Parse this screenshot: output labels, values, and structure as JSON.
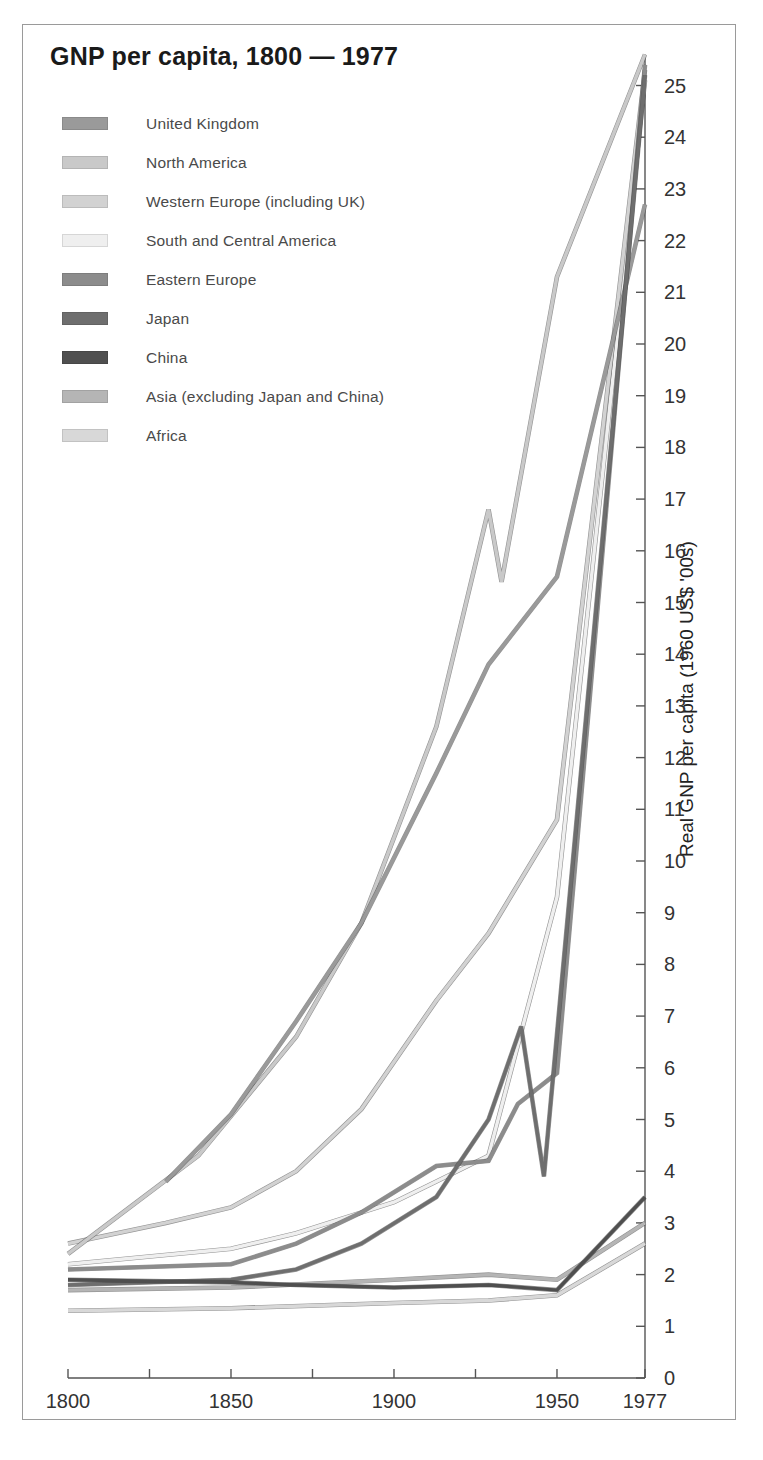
{
  "title": "GNP per capita, 1800 — 1977",
  "legend": [
    {
      "label": "United Kingdom",
      "color": "#9a9a9a"
    },
    {
      "label": "North America",
      "color": "#c9c9c9"
    },
    {
      "label": "Western Europe (including UK)",
      "color": "#d2d2d2"
    },
    {
      "label": "South and Central America",
      "color": "#efefef"
    },
    {
      "label": "Eastern Europe",
      "color": "#8c8c8c"
    },
    {
      "label": "Japan",
      "color": "#6e6e6e"
    },
    {
      "label": "China",
      "color": "#4f4f4f"
    },
    {
      "label": "Asia (excluding Japan and China)",
      "color": "#b5b5b5"
    },
    {
      "label": "Africa",
      "color": "#d8d8d8"
    }
  ],
  "axes": {
    "y_title": "Real GNP per capita (1960 US$ '00s)",
    "y_ticks": [
      0,
      1,
      2,
      3,
      4,
      5,
      6,
      7,
      8,
      9,
      10,
      11,
      12,
      13,
      14,
      15,
      16,
      17,
      18,
      19,
      20,
      21,
      22,
      23,
      24,
      25
    ],
    "x_ticks_major": [
      "1800",
      "1850",
      "1900",
      "1950",
      "1977"
    ],
    "x_ticks_minor": [
      1825,
      1875,
      1925
    ]
  },
  "chart_data": {
    "type": "line",
    "title": "GNP per capita, 1800 — 1977",
    "xlabel": "",
    "ylabel": "Real GNP per capita (1960 US$ '00s)",
    "xlim": [
      1800,
      1977
    ],
    "ylim": [
      0,
      25.6
    ],
    "grid": false,
    "legend_position": "top-left",
    "units_note": "values are hundreds of 1960 US dollars",
    "series": [
      {
        "name": "United Kingdom",
        "color": "#9a9a9a",
        "points": [
          [
            1830,
            3.8
          ],
          [
            1850,
            5.1
          ],
          [
            1870,
            6.9
          ],
          [
            1890,
            8.8
          ],
          [
            1913,
            11.7
          ],
          [
            1929,
            13.8
          ],
          [
            1950,
            15.5
          ],
          [
            1977,
            22.7
          ]
        ]
      },
      {
        "name": "North America",
        "color": "#c9c9c9",
        "points": [
          [
            1800,
            2.4
          ],
          [
            1840,
            4.3
          ],
          [
            1870,
            6.6
          ],
          [
            1890,
            8.8
          ],
          [
            1913,
            12.6
          ],
          [
            1929,
            16.8
          ],
          [
            1933,
            15.4
          ],
          [
            1950,
            21.3
          ],
          [
            1977,
            25.6
          ]
        ]
      },
      {
        "name": "Western Europe (including UK)",
        "color": "#d2d2d2",
        "points": [
          [
            1800,
            2.6
          ],
          [
            1830,
            3.0
          ],
          [
            1850,
            3.3
          ],
          [
            1870,
            4.0
          ],
          [
            1890,
            5.2
          ],
          [
            1913,
            7.3
          ],
          [
            1929,
            8.6
          ],
          [
            1950,
            10.8
          ],
          [
            1977,
            25.3
          ]
        ]
      },
      {
        "name": "South and Central America",
        "color": "#efefef",
        "points": [
          [
            1800,
            2.2
          ],
          [
            1850,
            2.5
          ],
          [
            1870,
            2.8
          ],
          [
            1900,
            3.4
          ],
          [
            1913,
            3.8
          ],
          [
            1929,
            4.3
          ],
          [
            1950,
            9.3
          ],
          [
            1977,
            25.1
          ]
        ]
      },
      {
        "name": "Eastern Europe",
        "color": "#8c8c8c",
        "points": [
          [
            1800,
            2.1
          ],
          [
            1850,
            2.2
          ],
          [
            1870,
            2.6
          ],
          [
            1890,
            3.2
          ],
          [
            1913,
            4.1
          ],
          [
            1929,
            4.2
          ],
          [
            1938,
            5.3
          ],
          [
            1950,
            5.9
          ],
          [
            1977,
            25.4
          ]
        ]
      },
      {
        "name": "Japan",
        "color": "#6e6e6e",
        "points": [
          [
            1800,
            1.8
          ],
          [
            1850,
            1.9
          ],
          [
            1870,
            2.1
          ],
          [
            1890,
            2.6
          ],
          [
            1913,
            3.5
          ],
          [
            1929,
            5.0
          ],
          [
            1939,
            6.8
          ],
          [
            1946,
            3.9
          ],
          [
            1977,
            25.2
          ]
        ]
      },
      {
        "name": "China",
        "color": "#4f4f4f",
        "points": [
          [
            1800,
            1.9
          ],
          [
            1850,
            1.85
          ],
          [
            1870,
            1.8
          ],
          [
            1900,
            1.75
          ],
          [
            1929,
            1.8
          ],
          [
            1950,
            1.7
          ],
          [
            1977,
            3.5
          ]
        ]
      },
      {
        "name": "Asia (excluding Japan and China)",
        "color": "#b5b5b5",
        "points": [
          [
            1800,
            1.7
          ],
          [
            1850,
            1.75
          ],
          [
            1900,
            1.9
          ],
          [
            1929,
            2.0
          ],
          [
            1950,
            1.9
          ],
          [
            1977,
            3.0
          ]
        ]
      },
      {
        "name": "Africa",
        "color": "#d8d8d8",
        "points": [
          [
            1800,
            1.3
          ],
          [
            1850,
            1.35
          ],
          [
            1900,
            1.45
          ],
          [
            1929,
            1.5
          ],
          [
            1950,
            1.6
          ],
          [
            1977,
            2.6
          ]
        ]
      }
    ]
  }
}
